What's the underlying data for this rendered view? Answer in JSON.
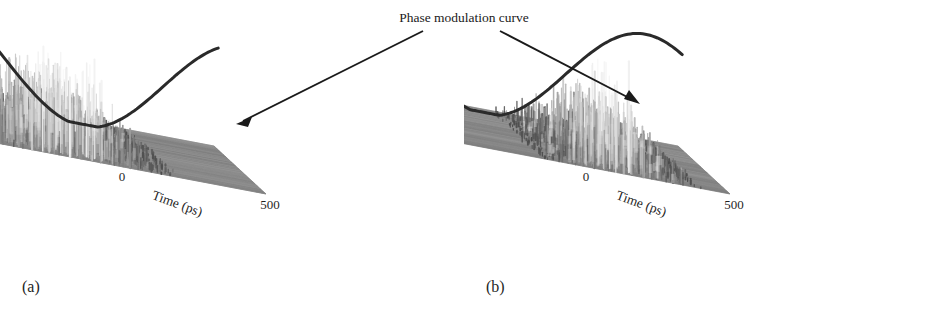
{
  "figure": {
    "background": "#ffffff",
    "annotation": {
      "text": "Phase modulation curve",
      "arrow_color": "#1a1a1a"
    },
    "panels": [
      {
        "id": "a",
        "label": "(a)",
        "exponent": "×10⁻³",
        "yaxis": {
          "title": "Intensity (a.u.)",
          "ticks": [
            "5",
            "10",
            "15"
          ],
          "values": [
            5,
            10,
            15
          ],
          "max": 17
        },
        "xaxis": {
          "title": "Time (ps)",
          "ticks": [
            "−500",
            "0",
            "500"
          ],
          "values": [
            -500,
            0,
            500
          ]
        },
        "zaxis": {
          "title": "Round trips",
          "ticks": [
            "0",
            "1000",
            "2000",
            "3000",
            "4000",
            "5000"
          ],
          "values": [
            0,
            1000,
            2000,
            3000,
            4000,
            5000
          ]
        },
        "curve_phase": 0.0,
        "burst_center": -180,
        "burst_width": 300,
        "surface_noise": "high"
      },
      {
        "id": "b",
        "label": "(b)",
        "exponent": "",
        "yaxis": {
          "title": "Intensity (a.u.)",
          "ticks": [
            "0.01",
            "0.02",
            "0.03"
          ],
          "values": [
            0.01,
            0.02,
            0.03
          ],
          "max": 0.038
        },
        "xaxis": {
          "title": "Time (ps)",
          "ticks": [
            "−500",
            "0",
            "500"
          ],
          "values": [
            -500,
            0,
            500
          ]
        },
        "zaxis": {
          "title": "Round trips",
          "ticks": [
            "0",
            "1000",
            "2000",
            "3000",
            "4000",
            "5000"
          ],
          "values": [
            0,
            1000,
            2000,
            3000,
            4000,
            5000
          ]
        },
        "curve_phase": 0.55,
        "burst_center": 130,
        "burst_width": 250,
        "surface_noise": "low"
      }
    ]
  },
  "chart_data": {
    "type": "surface",
    "xlabel": "Time (ps)",
    "ylabel": "Intensity (a.u.)",
    "zlabel": "Round trips",
    "xlim": [
      -500,
      500
    ],
    "zlim": [
      0,
      5000
    ],
    "grid": false,
    "legend": "none",
    "annotations": [
      {
        "text": "Phase modulation curve",
        "points_to": [
          "panel-a-curve",
          "panel-b-curve"
        ]
      }
    ],
    "panels": [
      {
        "id": "a",
        "ylim": [
          0,
          0.017
        ],
        "y_tick_values": [
          0.005,
          0.01,
          0.015
        ],
        "y_tick_labels": [
          "5",
          "10",
          "15"
        ],
        "y_exponent": -3,
        "x_tick_values": [
          -500,
          0,
          500
        ],
        "z_tick_values": [
          0,
          1000,
          2000,
          3000,
          4000,
          5000
        ],
        "phase_modulation_curve": {
          "description": "cosine phase modulation across the time window, peak near -350 ps, minimum near 150 ps",
          "peak_time_ps": -350,
          "peak_intensity": 0.0135,
          "min_time_ps": 160,
          "min_intensity": 0.0
        },
        "intensity_burst": {
          "description": "noisy spiking pulses concentrated toward early time, decaying with round trips",
          "center_time_ps": -180,
          "width_ps": 300,
          "peak_intensity": 0.0145
        }
      },
      {
        "id": "b",
        "ylim": [
          0,
          0.038
        ],
        "y_tick_values": [
          0.01,
          0.02,
          0.03
        ],
        "y_tick_labels": [
          "0.01",
          "0.02",
          "0.03"
        ],
        "y_exponent": 0,
        "x_tick_values": [
          -500,
          0,
          500
        ],
        "z_tick_values": [
          0,
          1000,
          2000,
          3000,
          4000,
          5000
        ],
        "phase_modulation_curve": {
          "description": "cosine phase modulation shifted, peak near -150 ps, minimum near 330 ps",
          "peak_time_ps": -150,
          "peak_intensity": 0.034,
          "min_time_ps": 330,
          "min_intensity": 0.0
        },
        "intensity_burst": {
          "description": "noisy spiking pulses concentrated right of center near curve minimum",
          "center_time_ps": 130,
          "width_ps": 250,
          "peak_intensity": 0.036
        }
      }
    ]
  }
}
